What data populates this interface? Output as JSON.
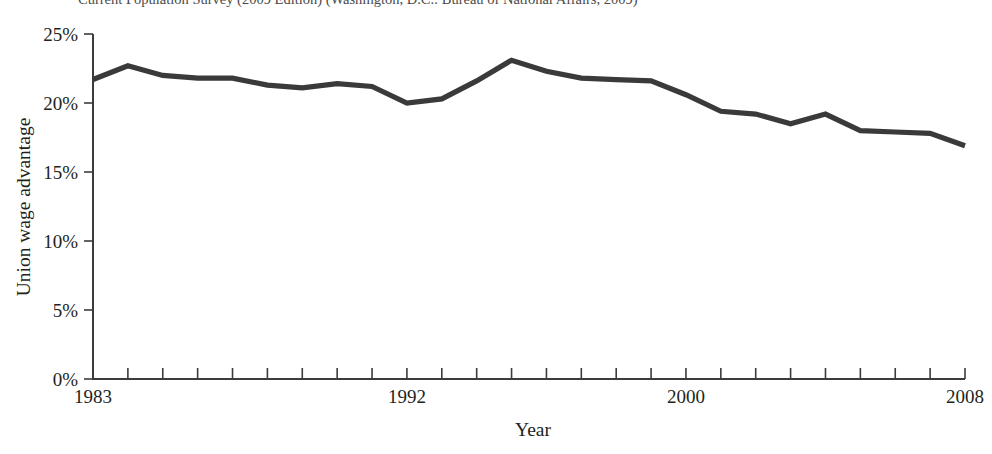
{
  "caption": {
    "text": "Current Population Survey (2009 Edition) (Washington, D.C.: Bureau of National Affairs, 2009)"
  },
  "chart_data": {
    "type": "line",
    "title": "",
    "xlabel": "Year",
    "ylabel": "Union wage advantage",
    "xlim": [
      1983,
      2008
    ],
    "ylim": [
      0,
      25
    ],
    "grid": false,
    "legend": null,
    "line_color": "#3a3a3a",
    "y_tick_labels": [
      "0%",
      "5%",
      "10%",
      "15%",
      "20%",
      "25%"
    ],
    "y_tick_values": [
      0,
      5,
      10,
      15,
      20,
      25
    ],
    "x_tick_labels": [
      "1983",
      "1992",
      "2000",
      "2008"
    ],
    "x_tick_values": [
      1983,
      1992,
      2000,
      2008
    ],
    "x_all_ticks": [
      1983,
      1984,
      1985,
      1986,
      1987,
      1988,
      1989,
      1990,
      1991,
      1992,
      1993,
      1994,
      1995,
      1996,
      1997,
      1998,
      1999,
      2000,
      2001,
      2002,
      2003,
      2004,
      2005,
      2006,
      2007,
      2008
    ],
    "x": [
      1983,
      1984,
      1985,
      1986,
      1987,
      1988,
      1989,
      1990,
      1991,
      1992,
      1993,
      1994,
      1995,
      1996,
      1997,
      1998,
      1999,
      2000,
      2001,
      2002,
      2003,
      2004,
      2005,
      2006,
      2007,
      2008
    ],
    "values": [
      21.7,
      22.7,
      22.0,
      21.8,
      21.8,
      21.3,
      21.1,
      21.4,
      21.2,
      20.0,
      20.3,
      21.6,
      23.1,
      22.3,
      21.8,
      21.7,
      21.6,
      20.6,
      19.4,
      19.2,
      18.5,
      19.2,
      18.0,
      17.9,
      17.8,
      16.9
    ],
    "series": [
      {
        "name": "Union wage advantage",
        "values": [
          21.7,
          22.7,
          22.0,
          21.8,
          21.8,
          21.3,
          21.1,
          21.4,
          21.2,
          20.0,
          20.3,
          21.6,
          23.1,
          22.3,
          21.8,
          21.7,
          21.6,
          20.6,
          19.4,
          19.2,
          18.5,
          19.2,
          18.0,
          17.9,
          17.8,
          16.9
        ]
      }
    ]
  }
}
